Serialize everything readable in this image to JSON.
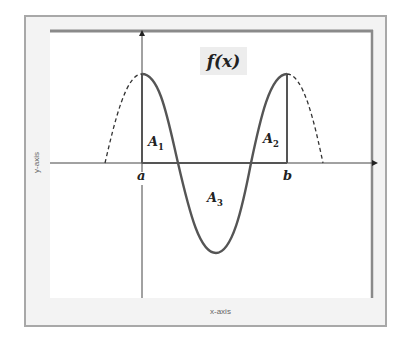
{
  "figure": {
    "function_label": "f(x)",
    "x_axis_title": "x-axis",
    "y_axis_title": "y-axis",
    "point_labels": {
      "a": "a",
      "b": "b"
    },
    "area_labels": [
      {
        "base": "A",
        "sub": "1"
      },
      {
        "base": "A",
        "sub": "2"
      },
      {
        "base": "A",
        "sub": "3"
      }
    ],
    "colors": {
      "curve": "#555555",
      "axis": "#444444",
      "frame_outer": "#a0a0a0",
      "frame_inner": "#8a8a8a",
      "frame_fill": "#f2f2f2",
      "label_box": "#ededed"
    }
  }
}
